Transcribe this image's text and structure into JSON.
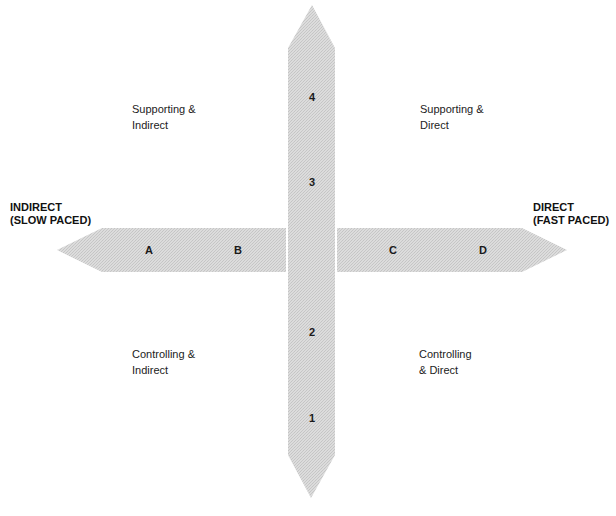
{
  "colors": {
    "arrow_fill": "#dcdcdc",
    "arrow_dot": "#c4c4c4",
    "text": "#1a1a1a"
  },
  "axes": {
    "horizontal": {
      "left_label": [
        "INDIRECT",
        "(SLOW PACED)"
      ],
      "right_label": [
        "DIRECT",
        "(FAST PACED)"
      ],
      "markers": [
        "A",
        "B",
        "C",
        "D"
      ]
    },
    "vertical": {
      "markers_top_to_bottom": [
        "4",
        "3",
        "2",
        "1"
      ]
    }
  },
  "quadrants": {
    "top_left": [
      "Supporting &",
      "Indirect"
    ],
    "top_right": [
      "Supporting &",
      "Direct"
    ],
    "bottom_left": [
      "Controlling &",
      "Indirect"
    ],
    "bottom_right": [
      "Controlling",
      "& Direct"
    ]
  }
}
